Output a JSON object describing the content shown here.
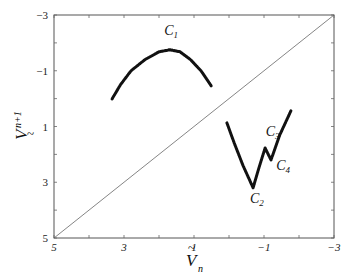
{
  "chart_data": {
    "type": "scatter",
    "title": "",
    "xlabel": "Ṽ_n",
    "ylabel": "Ṽ_{n+1}",
    "xlim": [
      5,
      -3
    ],
    "ylim": [
      5,
      -3
    ],
    "x_reversed": true,
    "y_reversed": true,
    "xticks": [
      5,
      3,
      1,
      -1,
      -3
    ],
    "yticks": [
      -3,
      -1,
      1,
      3,
      5
    ],
    "xtick_labels": [
      "5",
      "3",
      "1",
      "-1",
      "-3"
    ],
    "ytick_labels": [
      "-3",
      "-1",
      "1",
      "3",
      "5"
    ],
    "grid": false,
    "legend": null,
    "reference_line": {
      "name": "identity",
      "from": [
        5,
        5
      ],
      "to": [
        -3,
        -3
      ]
    },
    "series": [
      {
        "name": "C1",
        "points": [
          [
            3.34,
            0.01
          ],
          [
            3.1,
            -0.5
          ],
          [
            2.8,
            -1.0
          ],
          [
            2.4,
            -1.4
          ],
          [
            2.0,
            -1.68
          ],
          [
            1.69,
            -1.75
          ],
          [
            1.4,
            -1.68
          ],
          [
            1.1,
            -1.4
          ],
          [
            0.8,
            -1.0
          ],
          [
            0.51,
            -0.46
          ]
        ]
      },
      {
        "name": "C2-C3-C4",
        "points": [
          [
            0.06,
            0.87
          ],
          [
            -0.15,
            1.6
          ],
          [
            -0.4,
            2.4
          ],
          [
            -0.69,
            3.2
          ],
          [
            -0.85,
            2.5
          ],
          [
            -1.03,
            1.77
          ],
          [
            -1.2,
            2.2
          ],
          [
            -1.45,
            1.3
          ],
          [
            -1.77,
            0.44
          ]
        ]
      }
    ],
    "annotations": [
      {
        "label": "C",
        "sub": "1",
        "x": 1.85,
        "y": -2.3
      },
      {
        "label": "C",
        "sub": "2",
        "x": -0.6,
        "y": 3.75
      },
      {
        "label": "C",
        "sub": "3",
        "x": -1.05,
        "y": 1.35
      },
      {
        "label": "C",
        "sub": "4",
        "x": -1.35,
        "y": 2.55
      }
    ]
  },
  "labels": {
    "xlabel_main": "V",
    "xlabel_sub": "n",
    "ylabel_main": "V",
    "ylabel_sub": "n+1",
    "tilde": "~"
  }
}
